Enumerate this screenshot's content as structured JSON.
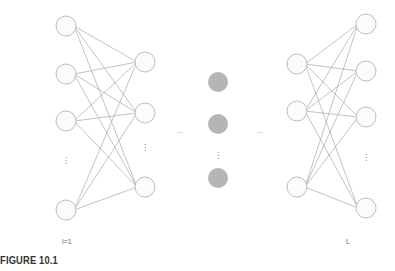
{
  "diagram": {
    "type": "fully-connected neural network",
    "edge_color": "#9a9a9a",
    "node_stroke": "#bdbdbd",
    "node_fill": "#fbfbfb",
    "hidden_fill": "#b5b5b5",
    "layers": [
      {
        "name": "input-layer",
        "x": 66,
        "nodes_y": [
          26,
          74,
          121,
          210
        ],
        "ellipsis_y": 163,
        "style": "outline"
      },
      {
        "name": "layer-2",
        "x": 145,
        "nodes_y": [
          62,
          113,
          187
        ],
        "ellipsis_y": 150,
        "style": "outline"
      },
      {
        "name": "middle-layer",
        "x": 218,
        "nodes_y": [
          82,
          124,
          178
        ],
        "ellipsis_y": 158,
        "style": "filled"
      },
      {
        "name": "layer-L-minus-1",
        "x": 297,
        "nodes_y": [
          64,
          111,
          187
        ],
        "ellipsis_y": null,
        "style": "outline"
      },
      {
        "name": "output-layer",
        "x": 366,
        "nodes_y": [
          24,
          71,
          117,
          208
        ],
        "ellipsis_y": 160,
        "style": "outline"
      }
    ],
    "horizontal_ellipses": [
      {
        "x": 180,
        "y": 133
      },
      {
        "x": 260,
        "y": 133
      }
    ],
    "connections": [
      [
        0,
        1
      ],
      [
        3,
        4
      ]
    ]
  },
  "labels": {
    "first_layer": "l=1",
    "last_layer": "L",
    "ellipsis_h": "...",
    "ellipsis_v": "⋮"
  },
  "caption": "FIGURE 10.1"
}
